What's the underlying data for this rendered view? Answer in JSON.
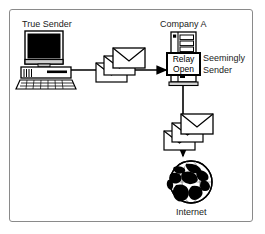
{
  "figure": {
    "type": "network-diagram",
    "title_text": "",
    "background": "#ffffff",
    "border_color": "#8a8a8a"
  },
  "labels": {
    "true_sender": "True Sender",
    "company_a": "Company A",
    "seemingly_sender_line1": "Seemingly",
    "seemingly_sender_line2": "Sender",
    "internet": "Internet"
  },
  "nodes": {
    "workstation": {
      "name": "True Sender",
      "icon": "desktop-computer-icon"
    },
    "server": {
      "name": "Company A mail server",
      "icon": "server-tower-icon",
      "badge_line1": "Relay",
      "badge_line2": "Open"
    },
    "globe": {
      "name": "Internet",
      "icon": "globe-icon"
    }
  },
  "flows": [
    {
      "from": "workstation",
      "to": "server",
      "direction": "right",
      "payload": "3 envelopes"
    },
    {
      "from": "server",
      "to": "globe",
      "direction": "down",
      "payload": "3 envelopes"
    }
  ],
  "envelopes": {
    "top_group_count": 3,
    "bottom_group_count": 3,
    "icon": "envelope-icon"
  },
  "colors": {
    "ink": "#000000",
    "frame": "#8a8a8a",
    "screen": "#000000",
    "device_fill": "#ffffff",
    "device_shade": "#b8b8b8"
  }
}
